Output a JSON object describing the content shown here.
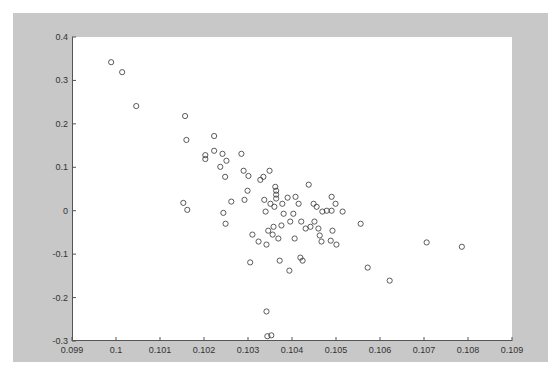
{
  "chart_data": {
    "type": "scatter",
    "title": "",
    "xlabel": "",
    "ylabel": "",
    "xlim": [
      0.099,
      0.109
    ],
    "ylim": [
      -0.3,
      0.4
    ],
    "grid": false,
    "legend": null,
    "marker": "open-circle",
    "marker_color": "#333333",
    "background_color": "#c8c8c8",
    "plot_color": "#ffffff",
    "x_ticks": [
      0.099,
      0.1,
      0.101,
      0.102,
      0.103,
      0.104,
      0.105,
      0.106,
      0.107,
      0.108,
      0.109
    ],
    "x_tick_labels": [
      "0.099",
      "0.1",
      "0.101",
      "0.102",
      "0.103",
      "0.104",
      "0.105",
      "0.106",
      "0.107",
      "0.108",
      "0.109"
    ],
    "y_ticks": [
      -0.3,
      -0.2,
      -0.1,
      0,
      0.1,
      0.2,
      0.3,
      0.4
    ],
    "y_tick_labels": [
      "-0.3",
      "-0.2",
      "-0.1",
      "0",
      "0.1",
      "0.2",
      "0.3",
      "0.4"
    ],
    "points": [
      [
        0.09989,
        0.342
      ],
      [
        0.10014,
        0.319
      ],
      [
        0.10046,
        0.241
      ],
      [
        0.10157,
        0.218
      ],
      [
        0.1016,
        0.163
      ],
      [
        0.10153,
        0.018
      ],
      [
        0.10162,
        0.002
      ],
      [
        0.10203,
        0.128
      ],
      [
        0.10203,
        0.119
      ],
      [
        0.10223,
        0.138
      ],
      [
        0.10223,
        0.172
      ],
      [
        0.10242,
        0.131
      ],
      [
        0.10251,
        0.115
      ],
      [
        0.10237,
        0.101
      ],
      [
        0.10248,
        0.078
      ],
      [
        0.10285,
        0.131
      ],
      [
        0.1029,
        0.092
      ],
      [
        0.10301,
        0.08
      ],
      [
        0.10299,
        0.046
      ],
      [
        0.10292,
        0.025
      ],
      [
        0.10262,
        0.021
      ],
      [
        0.10244,
        -0.005
      ],
      [
        0.10249,
        -0.03
      ],
      [
        0.10328,
        0.071
      ],
      [
        0.10335,
        0.078
      ],
      [
        0.10349,
        0.092
      ],
      [
        0.10337,
        0.025
      ],
      [
        0.10362,
        0.055
      ],
      [
        0.10364,
        0.046
      ],
      [
        0.10364,
        0.037
      ],
      [
        0.10364,
        0.028
      ],
      [
        0.10351,
        0.016
      ],
      [
        0.1036,
        0.009
      ],
      [
        0.10378,
        0.016
      ],
      [
        0.1039,
        0.03
      ],
      [
        0.10408,
        0.032
      ],
      [
        0.10415,
        0.016
      ],
      [
        0.10438,
        0.06
      ],
      [
        0.10449,
        0.016
      ],
      [
        0.10456,
        0.009
      ],
      [
        0.10469,
        -0.002
      ],
      [
        0.10479,
        0.0
      ],
      [
        0.1049,
        0.0
      ],
      [
        0.10515,
        -0.002
      ],
      [
        0.1049,
        0.032
      ],
      [
        0.10499,
        0.016
      ],
      [
        0.10556,
        -0.03
      ],
      [
        0.10706,
        -0.073
      ],
      [
        0.10786,
        -0.083
      ],
      [
        0.10572,
        -0.131
      ],
      [
        0.10622,
        -0.161
      ],
      [
        0.1031,
        -0.055
      ],
      [
        0.10324,
        -0.071
      ],
      [
        0.10305,
        -0.119
      ],
      [
        0.10342,
        -0.078
      ],
      [
        0.10356,
        -0.055
      ],
      [
        0.10369,
        -0.064
      ],
      [
        0.10372,
        -0.115
      ],
      [
        0.10394,
        -0.138
      ],
      [
        0.10406,
        -0.064
      ],
      [
        0.10419,
        -0.108
      ],
      [
        0.10424,
        -0.115
      ],
      [
        0.10376,
        -0.034
      ],
      [
        0.10358,
        -0.037
      ],
      [
        0.10346,
        -0.046
      ],
      [
        0.1034,
        -0.002
      ],
      [
        0.10381,
        -0.007
      ],
      [
        0.10396,
        -0.025
      ],
      [
        0.10403,
        -0.007
      ],
      [
        0.10421,
        -0.025
      ],
      [
        0.10431,
        -0.041
      ],
      [
        0.10442,
        -0.037
      ],
      [
        0.10451,
        -0.025
      ],
      [
        0.1046,
        -0.041
      ],
      [
        0.10463,
        -0.057
      ],
      [
        0.10467,
        -0.071
      ],
      [
        0.10488,
        -0.069
      ],
      [
        0.10492,
        -0.046
      ],
      [
        0.10501,
        -0.078
      ],
      [
        0.10342,
        -0.232
      ],
      [
        0.10344,
        -0.289
      ],
      [
        0.10353,
        -0.287
      ]
    ]
  }
}
